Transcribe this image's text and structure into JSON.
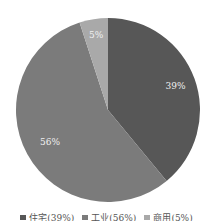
{
  "chart_data": {
    "type": "pie",
    "title": "",
    "categories": [
      "住宅",
      "工业",
      "商用"
    ],
    "values": [
      39,
      56,
      5
    ],
    "value_labels": [
      "39%",
      "56%",
      "5%"
    ],
    "colors": [
      "#575757",
      "#7b7b7b",
      "#a9a9a9"
    ],
    "start_angle_deg": 0,
    "direction": "clockwise",
    "legend_position": "bottom",
    "legend_labels_uncertain": true
  },
  "legend": {
    "items": [
      {
        "label": "住宅(39%)",
        "color": "#575757"
      },
      {
        "label": "工业(56%)",
        "color": "#7b7b7b"
      },
      {
        "label": "商用(5%)",
        "color": "#a9a9a9"
      }
    ]
  }
}
